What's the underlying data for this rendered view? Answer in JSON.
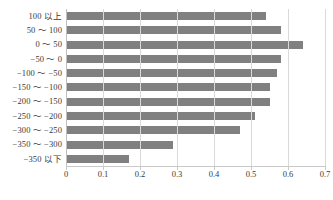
{
  "chart_data": {
    "type": "bar",
    "orientation": "horizontal",
    "title": "",
    "xlabel": "",
    "ylabel": "",
    "xlim": [
      0,
      0.7
    ],
    "xticks": [
      "0",
      "0.1",
      "0.2",
      "0.3",
      "0.4",
      "0.5",
      "0.6",
      "0.7"
    ],
    "xtick_values": [
      0,
      0.1,
      0.2,
      0.3,
      0.4,
      0.5,
      0.6,
      0.7
    ],
    "grid": true,
    "legend": "none",
    "bar_color": "#808080",
    "gridline_color": "#d9d9d9",
    "categories": [
      "100 以上",
      "50 ～ 100",
      "0 ～ 50",
      "−50 ～ 0",
      "−100 ～ −50",
      "−150 ～ −100",
      "−200 ～ −150",
      "−250 ～ −200",
      "−300 ～ −250",
      "−350 ～ −300",
      "−350 以下"
    ],
    "values": [
      0.54,
      0.58,
      0.64,
      0.58,
      0.57,
      0.55,
      0.55,
      0.51,
      0.47,
      0.29,
      0.17
    ]
  },
  "caption": ""
}
